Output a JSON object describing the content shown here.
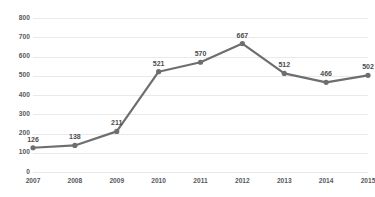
{
  "chart_data": {
    "type": "line",
    "title": "",
    "subtitle": "",
    "xlabel": "",
    "ylabel": "",
    "categories": [
      "2007",
      "2008",
      "2009",
      "2010",
      "2011",
      "2012",
      "2013",
      "2014",
      "2015"
    ],
    "values": [
      126,
      138,
      211,
      521,
      570,
      667,
      512,
      466,
      502
    ],
    "point_labels": [
      "126",
      "138",
      "211",
      "521",
      "570",
      "667",
      "512",
      "466",
      "502"
    ],
    "ylim": [
      0,
      800
    ],
    "ytick_values": [
      0,
      100,
      200,
      300,
      400,
      500,
      600,
      700,
      800
    ],
    "ytick_labels": [
      "0",
      "100",
      "200",
      "300",
      "400",
      "500",
      "600",
      "700",
      "800"
    ],
    "grid": {
      "horizontal": true,
      "vertical": false
    },
    "legend": {
      "visible": false,
      "position": "none"
    },
    "series": [
      {
        "name": "",
        "values": [
          126,
          138,
          211,
          521,
          570,
          667,
          512,
          466,
          502
        ],
        "line_color": "#6e6e6e",
        "marker_color": "#6e6e6e",
        "marker": "circle"
      }
    ],
    "colors": {
      "background": "#ffffff",
      "gridline": "#e9e9e9",
      "line": "#6e6e6e",
      "marker": "#6e6e6e",
      "axis_text": "#58595b",
      "label_text": "#4d4d4f"
    }
  }
}
